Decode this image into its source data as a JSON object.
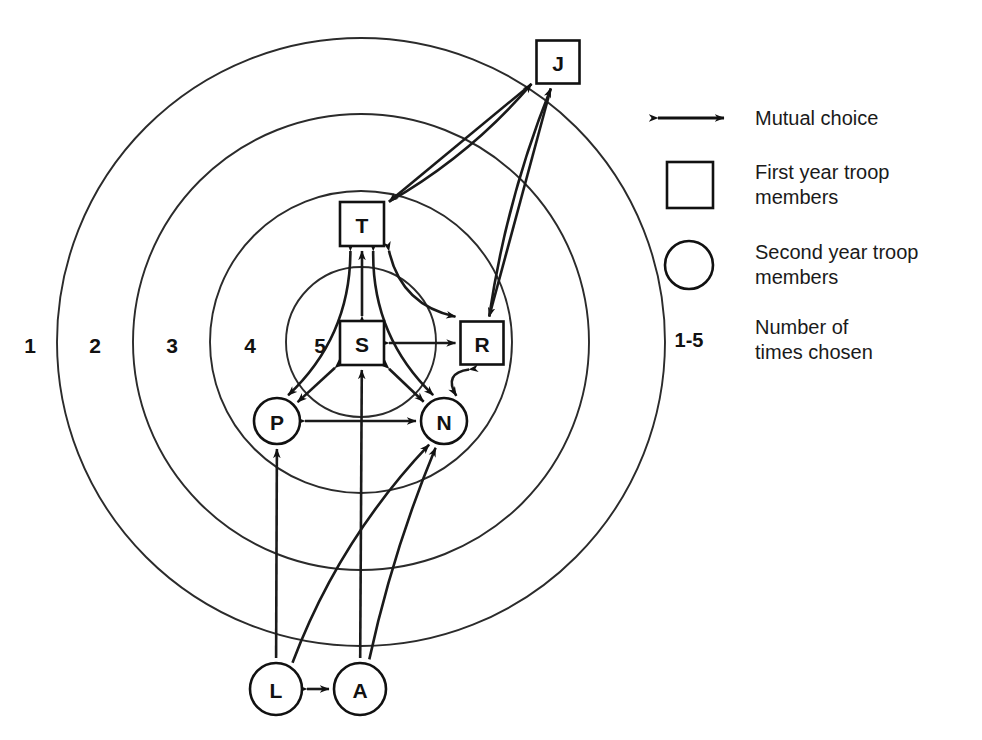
{
  "diagram": {
    "ring_labels": [
      "1",
      "2",
      "3",
      "4",
      "5"
    ],
    "ring_label_y": 345,
    "ring_label_x": [
      30,
      95,
      172,
      250,
      320
    ],
    "center": {
      "x": 361,
      "y": 342
    },
    "ring_radii": [
      304,
      228,
      151,
      75
    ],
    "nodes": [
      {
        "id": "J",
        "label": "J",
        "shape": "square",
        "x": 558,
        "y": 62,
        "size": 43,
        "group": "first-year"
      },
      {
        "id": "T",
        "label": "T",
        "shape": "square",
        "x": 362,
        "y": 224,
        "size": 44,
        "group": "first-year"
      },
      {
        "id": "S",
        "label": "S",
        "shape": "square",
        "x": 362,
        "y": 343,
        "size": 44,
        "group": "first-year"
      },
      {
        "id": "R",
        "label": "R",
        "shape": "square",
        "x": 482,
        "y": 343,
        "size": 43,
        "group": "first-year"
      },
      {
        "id": "P",
        "label": "P",
        "shape": "circle",
        "x": 277,
        "y": 421,
        "size": 23,
        "group": "second-year"
      },
      {
        "id": "N",
        "label": "N",
        "shape": "circle",
        "x": 444,
        "y": 421,
        "size": 23,
        "group": "second-year"
      },
      {
        "id": "L",
        "label": "L",
        "shape": "circle",
        "x": 276,
        "y": 689,
        "size": 26,
        "group": "second-year"
      },
      {
        "id": "A",
        "label": "A",
        "shape": "circle",
        "x": 360,
        "y": 689,
        "size": 26,
        "group": "second-year"
      }
    ],
    "edges": [
      {
        "from": "S",
        "to": "T",
        "type": "mutual"
      },
      {
        "from": "S",
        "to": "R",
        "type": "mutual"
      },
      {
        "from": "S",
        "to": "P",
        "type": "mutual"
      },
      {
        "from": "S",
        "to": "N",
        "type": "mutual"
      },
      {
        "from": "T",
        "to": "P",
        "type": "mutual"
      },
      {
        "from": "T",
        "to": "N",
        "type": "mutual"
      },
      {
        "from": "T",
        "to": "R",
        "type": "mutual"
      },
      {
        "from": "P",
        "to": "N",
        "type": "mutual"
      },
      {
        "from": "R",
        "to": "N",
        "type": "mutual"
      },
      {
        "from": "J",
        "to": "T",
        "type": "single"
      },
      {
        "from": "J",
        "to": "R",
        "type": "single"
      },
      {
        "from": "T",
        "to": "J",
        "type": "single"
      },
      {
        "from": "R",
        "to": "J",
        "type": "single"
      },
      {
        "from": "L",
        "to": "P",
        "type": "single"
      },
      {
        "from": "L",
        "to": "N",
        "type": "single"
      },
      {
        "from": "A",
        "to": "S",
        "type": "single"
      },
      {
        "from": "A",
        "to": "N",
        "type": "single"
      },
      {
        "from": "L",
        "to": "A",
        "type": "mutual"
      }
    ]
  },
  "legend": {
    "items": [
      {
        "key": "mutual-choice",
        "icon": "double-arrow",
        "line1": "Mutual choice",
        "line2": ""
      },
      {
        "key": "first-year-troop",
        "icon": "square",
        "line1": "First year troop",
        "line2": "members"
      },
      {
        "key": "second-year-troop",
        "icon": "circle",
        "line1": "Second year troop",
        "line2": "members"
      },
      {
        "key": "times-chosen",
        "icon": "range-label",
        "line1": "Number of",
        "line2": "times chosen",
        "range": "1-5"
      }
    ]
  },
  "colors": {
    "ink": "#1a1a1a",
    "ring": "#2b2b2b",
    "background": "#ffffff"
  }
}
